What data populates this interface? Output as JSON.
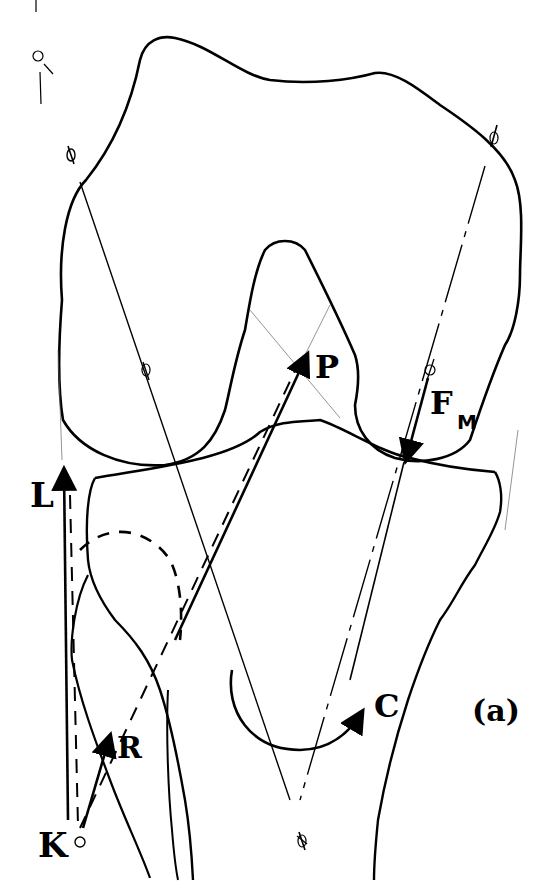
{
  "figure": {
    "panel_label": "(a)"
  },
  "labels": {
    "L": "L",
    "P": "P",
    "F": "F",
    "F_subscript": "M",
    "R": "R",
    "K": "K",
    "C": "C"
  },
  "legend_meaning": {
    "L": "vertical force vector at lateral edge (dashed line of action from K)",
    "P": "oblique force vector toward intercondylar notch",
    "F_M": "force vector pressing down on medial condyle",
    "R": "short force vector from point K",
    "K": "reference point (small circle)",
    "C": "curved moment arrow"
  },
  "colors": {
    "ink": "#000000",
    "background": "#ffffff",
    "faint_line": "#666666"
  }
}
